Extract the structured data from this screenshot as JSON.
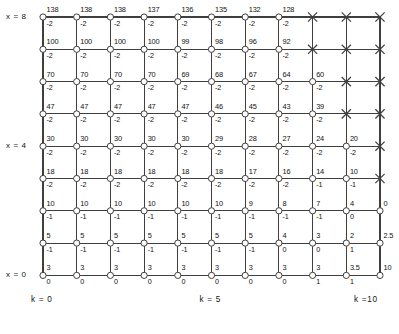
{
  "figure": {
    "axis_labels": {
      "left": [
        {
          "text": "x = 8",
          "row": 8
        },
        {
          "text": "x = 4",
          "row": 4
        },
        {
          "text": "x = 0",
          "row": 0
        }
      ],
      "bottom": [
        {
          "text": "k = 0",
          "col": 0
        },
        {
          "text": "k = 5",
          "col": 5
        },
        {
          "text": "k =10",
          "col": 10
        }
      ]
    },
    "colors": {
      "line": "#3f3f3f",
      "text": "#111111",
      "node_fill": "#ffffff",
      "background": "#ffffff"
    }
  },
  "chart_data": {
    "type": "heatmap",
    "xlabel": "k",
    "ylabel": "x",
    "x": [
      0,
      1,
      2,
      3,
      4,
      5,
      6,
      7,
      8,
      9,
      10
    ],
    "y": [
      0,
      1,
      2,
      3,
      4,
      5,
      6,
      7,
      8
    ],
    "xlim": [
      0,
      10
    ],
    "ylim": [
      0,
      8
    ],
    "grid": true,
    "legend": "none",
    "marker_blocked": "X",
    "note": "Each grid node shows a value (upper label) and a delta/decrement (lower label). Nodes marked X are blocked/undefined. Rows are listed from x = 8 down to x = 0.",
    "rows": [
      {
        "x": 8,
        "values": [
          "138",
          "138",
          "138",
          "137",
          "136",
          "135",
          "132",
          "128",
          "X",
          "X",
          "X"
        ],
        "deltas": [
          "-2",
          "-2",
          "-2",
          "-2",
          "-2",
          "-2",
          "-2",
          "-2",
          "",
          "",
          ""
        ]
      },
      {
        "x": 7,
        "values": [
          "100",
          "100",
          "100",
          "100",
          "99",
          "98",
          "96",
          "92",
          "X",
          "X",
          "X"
        ],
        "deltas": [
          "-2",
          "-2",
          "-2",
          "-2",
          "-2",
          "-2",
          "-2",
          "-2",
          "",
          "",
          ""
        ]
      },
      {
        "x": 6,
        "values": [
          "70",
          "70",
          "70",
          "70",
          "69",
          "68",
          "67",
          "64",
          "60",
          "X",
          "X"
        ],
        "deltas": [
          "-2",
          "-2",
          "-2",
          "-2",
          "-2",
          "-2",
          "-2",
          "-2",
          "-2",
          "",
          ""
        ]
      },
      {
        "x": 5,
        "values": [
          "47",
          "47",
          "47",
          "47",
          "47",
          "46",
          "45",
          "43",
          "39",
          "X",
          "X"
        ],
        "deltas": [
          "-2",
          "-2",
          "-2",
          "-2",
          "-2",
          "-2",
          "-2",
          "-2",
          "-2",
          "",
          ""
        ]
      },
      {
        "x": 4,
        "values": [
          "30",
          "30",
          "30",
          "30",
          "30",
          "29",
          "28",
          "27",
          "24",
          "20",
          "X"
        ],
        "deltas": [
          "-2",
          "-2",
          "-2",
          "-2",
          "-2",
          "-2",
          "-2",
          "-2",
          "-2",
          "-2",
          ""
        ]
      },
      {
        "x": 3,
        "values": [
          "18",
          "18",
          "18",
          "18",
          "18",
          "18",
          "17",
          "16",
          "14",
          "10",
          "X"
        ],
        "deltas": [
          "-2",
          "-2",
          "-2",
          "-2",
          "-2",
          "-2",
          "-2",
          "-2",
          "-1",
          "-1",
          ""
        ]
      },
      {
        "x": 2,
        "values": [
          "10",
          "10",
          "10",
          "10",
          "10",
          "10",
          "9",
          "8",
          "7",
          "4",
          "0"
        ],
        "deltas": [
          "-1",
          "-1",
          "-1",
          "-1",
          "-1",
          "-1",
          "-1",
          "-1",
          "-1",
          "0",
          ""
        ]
      },
      {
        "x": 1,
        "values": [
          "5",
          "5",
          "5",
          "5",
          "5",
          "5",
          "5",
          "4",
          "3",
          "2",
          "2.5"
        ],
        "deltas": [
          "-1",
          "-1",
          "-1",
          "-1",
          "-1",
          "-1",
          "-1",
          "0",
          "0",
          "1",
          ""
        ]
      },
      {
        "x": 0,
        "values": [
          "3",
          "3",
          "3",
          "3",
          "3",
          "3",
          "3",
          "3",
          "3",
          "3.5",
          "10"
        ],
        "deltas": [
          "0",
          "0",
          "0",
          "0",
          "0",
          "0",
          "0",
          "0",
          "1",
          "1",
          ""
        ]
      }
    ]
  }
}
